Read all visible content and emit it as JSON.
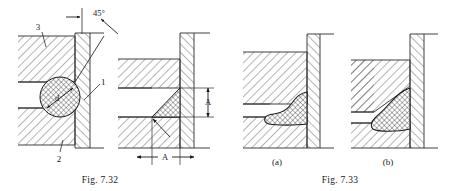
{
  "sheet": {
    "background": "#ffffff",
    "ink": "#1a1a1a",
    "line_color": "#2b2b2b"
  },
  "figures": [
    {
      "id": "fig-7-32",
      "caption": "Fig. 7.32",
      "panels": [
        {
          "id": "panel-ring",
          "description": "Sectioned joint with round cross-section sealing ring seated in 45 degree chamfer",
          "callouts": [
            {
              "name": "part-3",
              "text": "3"
            },
            {
              "name": "part-1",
              "text": "1"
            },
            {
              "name": "part-2",
              "text": "2"
            },
            {
              "name": "angle-45",
              "text": "45°"
            },
            {
              "name": "diameter-d",
              "text": "d"
            }
          ]
        },
        {
          "id": "panel-triangle",
          "description": "Sectioned joint with triangular weld/filler cross-section in the chamfer",
          "callouts": [
            {
              "name": "height-A",
              "text": "A"
            },
            {
              "name": "width-A",
              "text": "A"
            }
          ]
        }
      ]
    },
    {
      "id": "fig-7-33",
      "caption": "Fig. 7.33",
      "panels": [
        {
          "id": "panel-a",
          "sublabel": "(a)",
          "description": "Fillet weld bead with concave toe profile at square corner"
        },
        {
          "id": "panel-b",
          "sublabel": "(b)",
          "description": "Fillet weld bead seated against a chamfered corner"
        }
      ]
    }
  ],
  "legend": {
    "hatch_section": "section-hatching-45deg",
    "hatch_filler": "cross-hatch-filler"
  }
}
